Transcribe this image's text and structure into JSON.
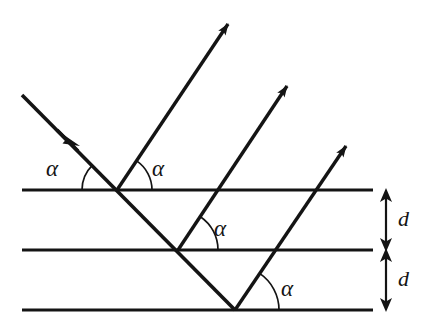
{
  "figure": {
    "type": "diagram",
    "background_color": "#ffffff",
    "stroke_color": "#141414",
    "width": 427,
    "height": 325
  },
  "lattice_planes": {
    "count": 3,
    "x_start": 22,
    "x_end": 373,
    "stroke_width": 3.2,
    "rows": [
      {
        "id": "plane-top",
        "y": 190
      },
      {
        "id": "plane-middle",
        "y": 250
      },
      {
        "id": "plane-bottom",
        "y": 310
      }
    ]
  },
  "incident_ray": {
    "id": "incident-ray",
    "x1": 22,
    "y1": 95,
    "x2": 235,
    "y2": 310,
    "arrow_at": {
      "x": 72,
      "y": 145
    },
    "stroke_width": 3.6
  },
  "diffracted_rays": [
    {
      "id": "diffracted-ray-1",
      "x1": 117,
      "y1": 190,
      "x2": 228,
      "y2": 24,
      "stroke_width": 3.4
    },
    {
      "id": "diffracted-ray-2",
      "x1": 178,
      "y1": 250,
      "x2": 287,
      "y2": 86,
      "stroke_width": 3.4
    },
    {
      "id": "diffracted-ray-3",
      "x1": 235,
      "y1": 310,
      "x2": 346,
      "y2": 146,
      "stroke_width": 3.4
    }
  ],
  "scattering_points": [
    {
      "id": "scatter-point-1",
      "x": 117,
      "y": 190
    },
    {
      "id": "scatter-point-2",
      "x": 178,
      "y": 250
    },
    {
      "id": "scatter-point-3",
      "x": 235,
      "y": 310
    }
  ],
  "angle_arcs": [
    {
      "id": "arc-incident-top",
      "cx": 117,
      "cy": 190,
      "r": 35,
      "start_deg": 135,
      "end_deg": 180,
      "side": "left"
    },
    {
      "id": "arc-reflected-top",
      "cx": 117,
      "cy": 190,
      "r": 35,
      "start_deg": 0,
      "end_deg": 56,
      "side": "right"
    },
    {
      "id": "arc-reflected-mid",
      "cx": 178,
      "cy": 250,
      "r": 40,
      "start_deg": 0,
      "end_deg": 56,
      "side": "right"
    },
    {
      "id": "arc-reflected-bot",
      "cx": 235,
      "cy": 310,
      "r": 44,
      "start_deg": 0,
      "end_deg": 56,
      "side": "right"
    }
  ],
  "angle_labels": [
    {
      "id": "alpha-incident-top",
      "text": "α",
      "x": 46,
      "y": 157
    },
    {
      "id": "alpha-reflected-top",
      "text": "α",
      "x": 152,
      "y": 157
    },
    {
      "id": "alpha-reflected-mid",
      "text": "α",
      "x": 214,
      "y": 217
    },
    {
      "id": "alpha-reflected-bot",
      "text": "α",
      "x": 281,
      "y": 277
    }
  ],
  "spacing_dimensions": [
    {
      "id": "spacing-upper",
      "label": "d",
      "arrow_x": 386,
      "y_top": 190,
      "y_bottom": 250,
      "label_x": 398,
      "label_y": 208
    },
    {
      "id": "spacing-lower",
      "label": "d",
      "arrow_x": 386,
      "y_top": 250,
      "y_bottom": 310,
      "label_x": 398,
      "label_y": 268
    }
  ],
  "tick_marks": {
    "note": "short horizontal plane end ticks at the right of each plane",
    "x_left": 366,
    "x_right": 373
  }
}
